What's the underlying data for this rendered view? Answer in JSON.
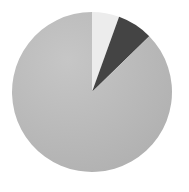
{
  "chart_data": {
    "type": "pie",
    "title": "",
    "categories": [
      "Slice A",
      "Slice B",
      "Slice C"
    ],
    "values": [
      5.5,
      7.2,
      87.3
    ],
    "colors": [
      "#ececec",
      "#444444",
      "#b8b8b8"
    ],
    "start_angle_deg": 0,
    "direction": "clockwise",
    "legend": "none",
    "labels_shown": false
  },
  "layout": {
    "center_x": 92,
    "center_y": 92,
    "radius": 80
  }
}
